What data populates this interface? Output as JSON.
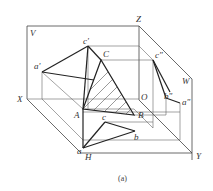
{
  "figure": {
    "caption": "(a)",
    "planes": {
      "V": "V",
      "H": "H",
      "W": "W"
    },
    "axes": {
      "X": "X",
      "Y": "Y",
      "Z": "Z",
      "O": "O"
    },
    "points": {
      "space": {
        "A": "A",
        "B": "B",
        "C": "C"
      },
      "front_view": {
        "a": "a'",
        "c": "c'"
      },
      "side_view": {
        "a": "a\"",
        "b": "b\"",
        "c": "c\""
      },
      "top_view": {
        "a": "a",
        "b": "b",
        "c": "c"
      }
    },
    "colors": {
      "line": "#333333",
      "thin_line": "#666666",
      "background": "#ffffff"
    }
  }
}
